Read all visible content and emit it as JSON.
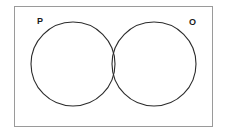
{
  "figure": {
    "type": "venn-diagram",
    "width": 227,
    "height": 134,
    "background_color": "#ffffff",
    "frame": {
      "name": "universal-set-rectangle",
      "border_color": "#9a9a9a",
      "fill_color": "#ffffff"
    },
    "stroke_color": "#2b2b2b",
    "label_color": "#1a1a1a"
  },
  "chart_data": {
    "type": "venn",
    "title": "",
    "sets": [
      {
        "id": "P",
        "label": "P",
        "cx": 73,
        "cy": 64,
        "r": 42,
        "label_position": "top-left",
        "fill": "none",
        "stroke": "#2b2b2b"
      },
      {
        "id": "O",
        "label": "O",
        "cx": 154,
        "cy": 64,
        "r": 42,
        "label_position": "top-right",
        "fill": "none",
        "stroke": "#2b2b2b"
      }
    ],
    "regions": [
      {
        "id": "P-only",
        "label": "",
        "value": null
      },
      {
        "id": "P-and-O",
        "label": "",
        "value": null
      },
      {
        "id": "O-only",
        "label": "",
        "value": null
      },
      {
        "id": "outside",
        "label": "",
        "value": null
      }
    ],
    "overlap": true,
    "legend": null,
    "annotations": []
  },
  "labels": {
    "set_p": "P",
    "set_o": "O"
  },
  "watermark": {
    "text": "",
    "color": "#c4c4c4"
  }
}
